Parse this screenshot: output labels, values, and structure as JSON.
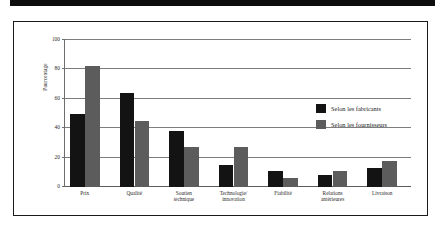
{
  "figure": {
    "top_rule": "top-rule",
    "frame": "figure-frame"
  },
  "chart_data": {
    "type": "bar",
    "title": "",
    "subtitle": "",
    "xlabel": "",
    "ylabel": "Pourcentage",
    "ylim": [
      0,
      100
    ],
    "yticks": [
      0,
      20,
      40,
      60,
      80,
      100
    ],
    "ytick_labels": [
      "0",
      "20",
      "40",
      "60",
      "80",
      "100"
    ],
    "grid": true,
    "grid_axis": "y",
    "legend_position": "right",
    "categories": [
      "Prix",
      "Qualité",
      "Soutien\ntechnique",
      "Technologie/\ninnovation",
      "Fiabilité",
      "Relations\nantérieures",
      "Livraison"
    ],
    "series": [
      {
        "name": "Selon les fabricants",
        "color": "#131313",
        "values": [
          50,
          64,
          38,
          15,
          11,
          8,
          13
        ]
      },
      {
        "name": "Selon les fournisseurs",
        "color": "#5c5c5c",
        "values": [
          82,
          45,
          27,
          27,
          6,
          11,
          18
        ]
      }
    ]
  },
  "legend": {
    "items": [
      {
        "label": "Selon les fabricants",
        "color": "#131313"
      },
      {
        "label": "Selon les fournisseurs",
        "color": "#5c5c5c"
      }
    ]
  },
  "colors": {
    "series_fabricants": "#131313",
    "series_fournisseurs": "#5c5c5c",
    "grid": "#7d7d7d",
    "frame": "#1b1b1b",
    "rule": "#0d0d0d"
  }
}
